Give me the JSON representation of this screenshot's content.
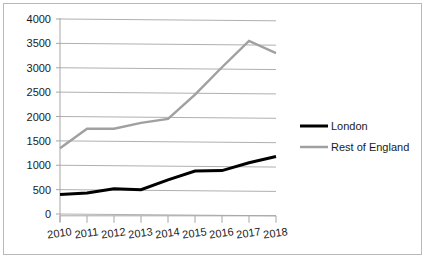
{
  "chart_data": {
    "type": "line",
    "title": "",
    "subtitle": "",
    "xlabel": "",
    "ylabel": "",
    "categories": [
      "2010",
      "2011",
      "2012",
      "2013",
      "2014",
      "2015",
      "2016",
      "2017",
      "2018"
    ],
    "x": [
      2010,
      2011,
      2012,
      2013,
      2014,
      2015,
      2016,
      2017,
      2018
    ],
    "series": [
      {
        "name": "London",
        "color": "#000000",
        "values": [
          400,
          430,
          520,
          500,
          700,
          880,
          890,
          1050,
          1180
        ]
      },
      {
        "name": "Rest of England",
        "color": "#a0a0a0",
        "values": [
          1350,
          1750,
          1750,
          1870,
          1950,
          2450,
          3010,
          3550,
          3300
        ]
      }
    ],
    "ylim": [
      0,
      4000
    ],
    "yticks": [
      0,
      500,
      1000,
      1500,
      2000,
      2500,
      3000,
      3500,
      4000
    ],
    "ytick_labels": [
      "0",
      "500",
      "1000",
      "1500",
      "2000",
      "2500",
      "3000",
      "3500",
      "4000"
    ],
    "grid": true,
    "grid_axis": "y",
    "legend_position": "right",
    "legend": [
      {
        "label": "London",
        "color": "#000000",
        "line_width": 3
      },
      {
        "label": "Rest of England",
        "color": "#a0a0a0",
        "line_width": 2.5
      }
    ]
  },
  "axes": {
    "y_axis_name": "value-axis",
    "x_axis_name": "year-axis"
  }
}
